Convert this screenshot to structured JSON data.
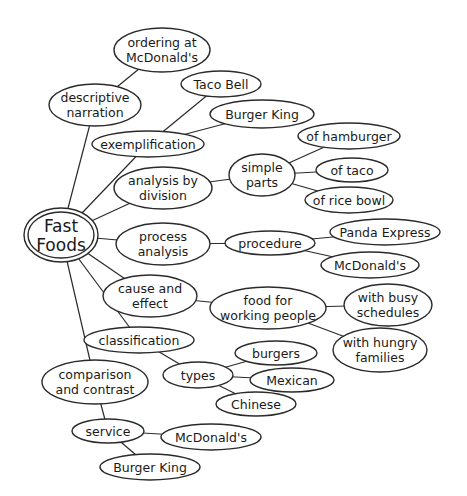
{
  "diagram": {
    "type": "cluster-map",
    "center": {
      "id": "fast_foods",
      "label": [
        "Fast",
        "Foods"
      ],
      "cx": 61,
      "cy": 235,
      "rx": 37,
      "ry": 27
    },
    "nodes": [
      {
        "id": "ordering",
        "label": [
          "ordering at",
          "McDonald's"
        ],
        "cx": 162,
        "cy": 50,
        "rx": 48,
        "ry": 22
      },
      {
        "id": "descriptive",
        "label": [
          "descriptive",
          "narration"
        ],
        "cx": 95,
        "cy": 105,
        "rx": 46,
        "ry": 21
      },
      {
        "id": "taco_bell",
        "label": [
          "Taco Bell"
        ],
        "cx": 221,
        "cy": 84,
        "rx": 40,
        "ry": 13
      },
      {
        "id": "burger_king_top",
        "label": [
          "Burger King"
        ],
        "cx": 262,
        "cy": 114,
        "rx": 52,
        "ry": 14
      },
      {
        "id": "exemplification",
        "label": [
          "exemplification"
        ],
        "cx": 148,
        "cy": 144,
        "rx": 56,
        "ry": 13
      },
      {
        "id": "of_hamburger",
        "label": [
          "of hamburger"
        ],
        "cx": 349,
        "cy": 136,
        "rx": 51,
        "ry": 13
      },
      {
        "id": "simple_parts",
        "label": [
          "simple",
          "parts"
        ],
        "cx": 262,
        "cy": 175,
        "rx": 33,
        "ry": 21
      },
      {
        "id": "of_taco",
        "label": [
          "of taco"
        ],
        "cx": 352,
        "cy": 170,
        "rx": 36,
        "ry": 12
      },
      {
        "id": "of_rice_bowl",
        "label": [
          "of rice bowl"
        ],
        "cx": 349,
        "cy": 200,
        "rx": 44,
        "ry": 13
      },
      {
        "id": "analysis_division",
        "label": [
          "analysis by",
          "division"
        ],
        "cx": 163,
        "cy": 188,
        "rx": 49,
        "ry": 21
      },
      {
        "id": "process_analysis",
        "label": [
          "process",
          "analysis"
        ],
        "cx": 163,
        "cy": 244,
        "rx": 47,
        "ry": 21
      },
      {
        "id": "procedure",
        "label": [
          "procedure"
        ],
        "cx": 270,
        "cy": 243,
        "rx": 45,
        "ry": 12
      },
      {
        "id": "panda_express",
        "label": [
          "Panda Express"
        ],
        "cx": 385,
        "cy": 232,
        "rx": 55,
        "ry": 13
      },
      {
        "id": "mcdonalds_proc",
        "label": [
          "McDonald's"
        ],
        "cx": 370,
        "cy": 265,
        "rx": 49,
        "ry": 13
      },
      {
        "id": "cause_effect",
        "label": [
          "cause and",
          "effect"
        ],
        "cx": 150,
        "cy": 296,
        "rx": 47,
        "ry": 21
      },
      {
        "id": "food_working",
        "label": [
          "food for",
          "working people"
        ],
        "cx": 268,
        "cy": 308,
        "rx": 58,
        "ry": 21
      },
      {
        "id": "busy",
        "label": [
          "with busy",
          "schedules"
        ],
        "cx": 388,
        "cy": 305,
        "rx": 44,
        "ry": 21
      },
      {
        "id": "hungry",
        "label": [
          "with hungry",
          "families"
        ],
        "cx": 380,
        "cy": 350,
        "rx": 47,
        "ry": 22
      },
      {
        "id": "classification",
        "label": [
          "classification"
        ],
        "cx": 139,
        "cy": 340,
        "rx": 55,
        "ry": 13
      },
      {
        "id": "burgers",
        "label": [
          "burgers"
        ],
        "cx": 276,
        "cy": 353,
        "rx": 41,
        "ry": 12
      },
      {
        "id": "types",
        "label": [
          "types"
        ],
        "cx": 198,
        "cy": 375,
        "rx": 35,
        "ry": 13
      },
      {
        "id": "mexican",
        "label": [
          "Mexican"
        ],
        "cx": 292,
        "cy": 380,
        "rx": 42,
        "ry": 12
      },
      {
        "id": "chinese",
        "label": [
          "Chinese"
        ],
        "cx": 256,
        "cy": 404,
        "rx": 40,
        "ry": 12
      },
      {
        "id": "comparison",
        "label": [
          "comparison",
          "and contrast"
        ],
        "cx": 95,
        "cy": 382,
        "rx": 53,
        "ry": 22
      },
      {
        "id": "service",
        "label": [
          "service"
        ],
        "cx": 108,
        "cy": 431,
        "rx": 36,
        "ry": 12
      },
      {
        "id": "mcdonalds_service",
        "label": [
          "McDonald's"
        ],
        "cx": 211,
        "cy": 437,
        "rx": 50,
        "ry": 13
      },
      {
        "id": "burger_king_bottom",
        "label": [
          "Burger King"
        ],
        "cx": 150,
        "cy": 467,
        "rx": 50,
        "ry": 13
      }
    ],
    "edges": [
      [
        "fast_foods",
        "descriptive"
      ],
      [
        "descriptive",
        "ordering"
      ],
      [
        "fast_foods",
        "exemplification"
      ],
      [
        "exemplification",
        "taco_bell"
      ],
      [
        "exemplification",
        "burger_king_top"
      ],
      [
        "fast_foods",
        "analysis_division"
      ],
      [
        "analysis_division",
        "simple_parts"
      ],
      [
        "simple_parts",
        "of_hamburger"
      ],
      [
        "simple_parts",
        "of_taco"
      ],
      [
        "simple_parts",
        "of_rice_bowl"
      ],
      [
        "fast_foods",
        "process_analysis"
      ],
      [
        "process_analysis",
        "procedure"
      ],
      [
        "procedure",
        "panda_express"
      ],
      [
        "procedure",
        "mcdonalds_proc"
      ],
      [
        "fast_foods",
        "cause_effect"
      ],
      [
        "cause_effect",
        "food_working"
      ],
      [
        "food_working",
        "busy"
      ],
      [
        "food_working",
        "hungry"
      ],
      [
        "fast_foods",
        "classification"
      ],
      [
        "classification",
        "types"
      ],
      [
        "types",
        "burgers"
      ],
      [
        "types",
        "mexican"
      ],
      [
        "types",
        "chinese"
      ],
      [
        "fast_foods",
        "comparison"
      ],
      [
        "comparison",
        "service"
      ],
      [
        "service",
        "mcdonalds_service"
      ],
      [
        "service",
        "burger_king_bottom"
      ]
    ],
    "colors": {
      "stroke": "#2a2a2a",
      "fill": "#ffffff",
      "text": "#1a1a1a"
    }
  }
}
